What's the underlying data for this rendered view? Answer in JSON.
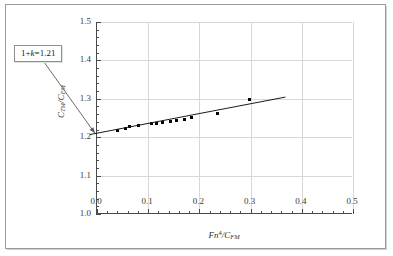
{
  "figure": {
    "background_color": "#ffffff",
    "frame_color": "#9a9a9a",
    "axis_color": "#4a4a4a",
    "grid_color": "#d8d8d8",
    "marker_color": "#000000",
    "line_color": "#1a1a1a"
  },
  "annotation": {
    "label": "1+k=1.21",
    "prefix": "1+",
    "symbol": "k",
    "equals": "=",
    "value": "1.21"
  },
  "axes": {
    "xlabel_parts": {
      "main": "Fn",
      "exponent": "4",
      "divider": "/C",
      "subscript": "FM"
    },
    "ylabel_parts": {
      "main": "C",
      "subscript1": "TM",
      "divider": "/C",
      "subscript2": "FM"
    },
    "xticklabels": [
      "0.0",
      "0.1",
      "0.2",
      "0.3",
      "0.4",
      "0.5"
    ],
    "yticklabels": [
      "1.0",
      "1.1",
      "1.2",
      "1.3",
      "1.4",
      "1.5"
    ]
  },
  "chart_data": {
    "type": "scatter",
    "title": "",
    "subtitle": "",
    "xlabel": "Fn^4/C_FM",
    "ylabel": "C_TM/C_FM",
    "xlim": [
      0.0,
      0.5
    ],
    "ylim": [
      1.0,
      1.5
    ],
    "xticks": [
      0.0,
      0.1,
      0.2,
      0.3,
      0.4,
      0.5
    ],
    "yticks": [
      1.0,
      1.1,
      1.2,
      1.3,
      1.4,
      1.5
    ],
    "x_minor_tick_step": 0.02,
    "y_minor_tick_step": 0.02,
    "grid": true,
    "legend": false,
    "legend_position": "none",
    "annotations": [
      {
        "text": "1+k=1.21",
        "type": "boxed-callout-with-leader",
        "points_to": {
          "x": 0.0,
          "y": 1.21
        },
        "box_position": "upper-left-outside-axes"
      }
    ],
    "series": [
      {
        "name": "measured data",
        "type": "scatter",
        "marker": "square",
        "marker_size": 3,
        "color": "#000000",
        "points": [
          {
            "x": 0.04,
            "y": 1.2165
          },
          {
            "x": 0.056,
            "y": 1.2215
          },
          {
            "x": 0.064,
            "y": 1.227
          },
          {
            "x": 0.082,
            "y": 1.2295
          },
          {
            "x": 0.106,
            "y": 1.235
          },
          {
            "x": 0.117,
            "y": 1.236
          },
          {
            "x": 0.128,
            "y": 1.2375
          },
          {
            "x": 0.143,
            "y": 1.2415
          },
          {
            "x": 0.156,
            "y": 1.2435
          },
          {
            "x": 0.17,
            "y": 1.2465
          },
          {
            "x": 0.185,
            "y": 1.251
          },
          {
            "x": 0.236,
            "y": 1.2625
          },
          {
            "x": 0.298,
            "y": 1.298
          }
        ]
      },
      {
        "name": "linear regression fit",
        "type": "line",
        "color": "#1a1a1a",
        "linewidth": 1,
        "intercept": 1.21,
        "slope": 0.2553,
        "endpoints": [
          {
            "x": -0.012,
            "y": 1.2069
          },
          {
            "x": 0.37,
            "y": 1.3045
          }
        ]
      }
    ]
  }
}
